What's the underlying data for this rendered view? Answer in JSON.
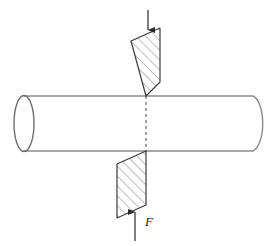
{
  "figure": {
    "background_color": "#ffffff"
  },
  "colors": {
    "cylinder_outline": "#8c8c8c",
    "plane_outline": "#3c3c3c",
    "hatch_line": "#6e6e6e",
    "dashed_centerline": "#5a5a5a",
    "arrow": "#2b2b2b",
    "label_text": "#1a1a1a"
  },
  "cylinder": {
    "name": "horizontal-cylindrical-bar",
    "left_face_center_x": 24,
    "left_face_center_y": 123,
    "left_face_rx": 10,
    "left_face_ry": 28,
    "top_edge_y": 96,
    "bottom_edge_y": 151,
    "body_left_x": 24,
    "body_right_x": 253,
    "right_cap_rx": 12,
    "right_cap_ry": 28
  },
  "centerline": {
    "name": "section-centerline",
    "x": 146,
    "y_top": 96,
    "y_bottom": 151,
    "style": "dashed"
  },
  "planes": [
    {
      "name": "upper-shear-plane",
      "position": "above-cylinder",
      "points": "131,41 160,28 160,82 146,96",
      "hatch_direction": "lower-left-to-upper-right",
      "hatch_angle_deg": 45
    },
    {
      "name": "lower-shear-plane",
      "position": "below-cylinder",
      "points": "146,151 146,205 117,218 117,164",
      "hatch_direction": "lower-left-to-upper-right",
      "hatch_angle_deg": 45
    }
  ],
  "arrows": [
    {
      "name": "top-force-arrow",
      "direction": "down",
      "x": 148,
      "y_start": 10,
      "y_end": 32,
      "label": ""
    },
    {
      "name": "bottom-force-arrow",
      "direction": "up",
      "x": 135,
      "y_start": 240,
      "y_end": 210,
      "label": "F"
    }
  ],
  "labels": {
    "force": "F",
    "force_x": 146,
    "force_y": 226
  }
}
